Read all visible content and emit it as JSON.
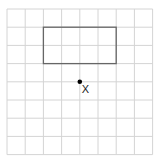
{
  "grid": {
    "origin_x": 7,
    "origin_y": 9,
    "cell": 18.2,
    "cols": 8,
    "rows": 8,
    "line_color": "#d4d4d4"
  },
  "rectangle": {
    "col": 2,
    "row": 1,
    "width_cells": 4,
    "height_cells": 2,
    "stroke": "#666666"
  },
  "point": {
    "col": 4,
    "row": 4,
    "label": "X",
    "color": "#000000"
  }
}
